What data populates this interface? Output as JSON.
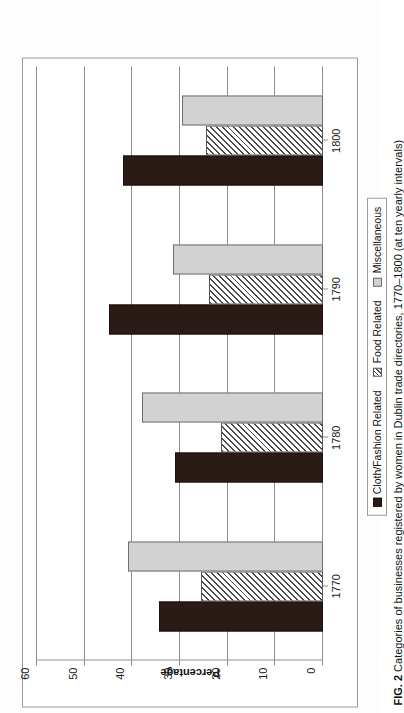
{
  "figure": {
    "number_label": "FIG. 2",
    "caption": "Categories of businesses registered by women in Dublin trade directories, 1770–1800 (at ten yearly intervals)"
  },
  "legend": {
    "items": [
      {
        "label": "Cloth/Fashion Related",
        "swatch": "solid-dark-brown",
        "color": "#2b1b16"
      },
      {
        "label": "Food Related",
        "swatch": "diagonal-hatch",
        "color": "#4a4a4a"
      },
      {
        "label": "Miscellaneous",
        "swatch": "solid-light-gray",
        "color": "#d2d2d2"
      }
    ]
  },
  "chart_data": {
    "type": "bar",
    "title": "",
    "orientation": "vertical-bars-rendered-sideways",
    "categories": [
      "1770",
      "1780",
      "1790",
      "1800"
    ],
    "xlabel": "",
    "ylabel": "Percentage",
    "ylim": [
      0,
      60
    ],
    "yticks": [
      0,
      10,
      20,
      30,
      40,
      50,
      60
    ],
    "ytick_labels": [
      "0",
      "10",
      "20",
      "30",
      "40",
      "50",
      "60"
    ],
    "grid": true,
    "legend_position": "bottom",
    "series": [
      {
        "name": "Cloth/Fashion Related",
        "values": [
          34.5,
          31,
          45,
          42
        ]
      },
      {
        "name": "Food Related",
        "values": [
          25.5,
          21.5,
          24,
          24.5
        ]
      },
      {
        "name": "Miscellaneous",
        "values": [
          41,
          38,
          31.5,
          29.5
        ]
      }
    ]
  }
}
